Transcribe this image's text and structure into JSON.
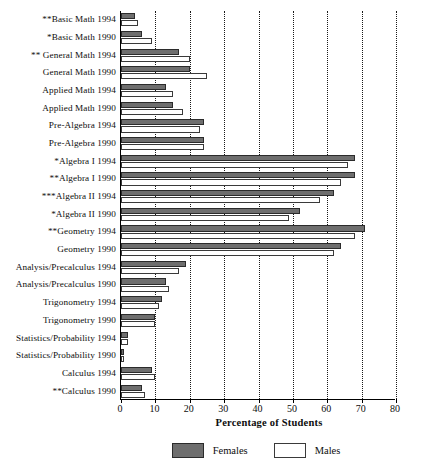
{
  "chart_data": {
    "type": "bar",
    "orientation": "horizontal",
    "title": "",
    "xlabel": "Percentage of Students",
    "ylabel": "",
    "xlim": [
      0,
      80
    ],
    "xticks": [
      0,
      10,
      20,
      30,
      40,
      50,
      60,
      70,
      80
    ],
    "grid": true,
    "grid_style": "dotted-vertical",
    "legend_position": "bottom-center",
    "categories": [
      "**Basic Math 1994",
      "*Basic Math 1990",
      "** General Math 1994",
      "General Math 1990",
      "Applied Math 1994",
      "Applied Math 1990",
      "Pre-Algebra 1994",
      "Pre-Algebra 1990",
      "*Algebra I 1994",
      "**Algebra I 1990",
      "***Algebra II 1994",
      "*Algebra II 1990",
      "**Geometry 1994",
      "Geometry 1990",
      "Analysis/Precalculus 1994",
      "Analysis/Precalculus 1990",
      "Trigonometry 1994",
      "Trigonometry 1990",
      "Statistics/Probability 1994",
      "Statistics/Probability 1990",
      "Calculus 1994",
      "**Calculus 1990"
    ],
    "series": [
      {
        "name": "Females",
        "color": "#6e6e6e",
        "values": [
          4,
          6,
          17,
          20,
          13,
          15,
          24,
          24,
          68,
          68,
          62,
          52,
          71,
          64,
          19,
          13,
          12,
          10,
          2,
          1,
          9,
          6
        ]
      },
      {
        "name": "Males",
        "color": "#ffffff",
        "values": [
          5,
          9,
          20,
          25,
          15,
          18,
          23,
          24,
          66,
          64,
          58,
          49,
          68,
          62,
          17,
          14,
          11,
          10,
          2,
          1,
          10,
          7
        ]
      }
    ]
  },
  "legend": {
    "items": [
      {
        "label": "Females",
        "swatch": "females-swatch"
      },
      {
        "label": "Males",
        "swatch": "males-swatch"
      }
    ]
  },
  "axis": {
    "x_title": "Percentage of Students"
  }
}
